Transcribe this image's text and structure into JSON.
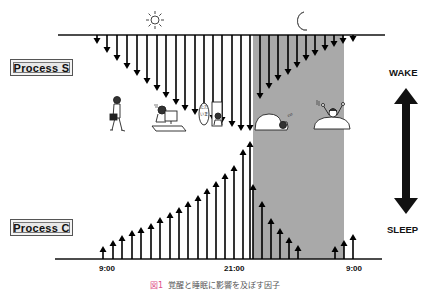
{
  "figure": {
    "process_s_label": "Process  S",
    "process_c_label": "Process  C",
    "wake_label": "WAKE",
    "sleep_label": "SLEEP",
    "x_ticks": [
      {
        "label": "9:00",
        "x": 108
      },
      {
        "label": "21:00",
        "x": 235
      },
      {
        "label": "9:00",
        "x": 356
      }
    ],
    "icons": {
      "day": "sun-icon",
      "night": "moon-icon"
    },
    "illustrations": [
      "person-walking-to-work",
      "person-at-computer",
      "person-saying-tadaima-at-door",
      "person-sleeping-in-bed",
      "person-waking-up-stretching"
    ],
    "speech_bubble_text": "ただいま",
    "caption_figure": "図1",
    "caption_text": "覚醒と睡眠に影響を及ぼす因子",
    "colors": {
      "night_shade": "#a9a9a9",
      "arrow": "#000000",
      "caption_accent": "#e0508a"
    }
  },
  "chart_data": {
    "type": "diagram",
    "time_axis": [
      "9:00",
      "21:00",
      "9:00"
    ],
    "night_period": {
      "start_x": 253,
      "end_x": 344
    },
    "process_s_down_arrows": [
      {
        "x": 97,
        "tip": 43
      },
      {
        "x": 107,
        "tip": 52
      },
      {
        "x": 117,
        "tip": 60
      },
      {
        "x": 127,
        "tip": 68
      },
      {
        "x": 137,
        "tip": 75
      },
      {
        "x": 147,
        "tip": 83
      },
      {
        "x": 157,
        "tip": 90
      },
      {
        "x": 166,
        "tip": 97
      },
      {
        "x": 176,
        "tip": 104
      },
      {
        "x": 185,
        "tip": 110
      },
      {
        "x": 195,
        "tip": 114
      },
      {
        "x": 204,
        "tip": 118
      },
      {
        "x": 213,
        "tip": 120
      },
      {
        "x": 222,
        "tip": 122
      },
      {
        "x": 232,
        "tip": 126
      },
      {
        "x": 241,
        "tip": 130
      },
      {
        "x": 250,
        "tip": 130
      },
      {
        "x": 260,
        "tip": 98
      },
      {
        "x": 269,
        "tip": 88
      },
      {
        "x": 278,
        "tip": 80
      },
      {
        "x": 288,
        "tip": 74
      },
      {
        "x": 297,
        "tip": 67
      },
      {
        "x": 306,
        "tip": 60
      },
      {
        "x": 315,
        "tip": 55
      },
      {
        "x": 325,
        "tip": 50
      },
      {
        "x": 334,
        "tip": 46
      },
      {
        "x": 343,
        "tip": 43
      },
      {
        "x": 353,
        "tip": 41
      }
    ],
    "process_c_up_arrows": [
      {
        "x": 103,
        "tip": 247
      },
      {
        "x": 113,
        "tip": 241
      },
      {
        "x": 122,
        "tip": 236
      },
      {
        "x": 132,
        "tip": 231
      },
      {
        "x": 141,
        "tip": 228
      },
      {
        "x": 151,
        "tip": 224
      },
      {
        "x": 160,
        "tip": 218
      },
      {
        "x": 170,
        "tip": 213
      },
      {
        "x": 179,
        "tip": 208
      },
      {
        "x": 188,
        "tip": 202
      },
      {
        "x": 198,
        "tip": 196
      },
      {
        "x": 207,
        "tip": 189
      },
      {
        "x": 216,
        "tip": 182
      },
      {
        "x": 225,
        "tip": 174
      },
      {
        "x": 234,
        "tip": 166
      },
      {
        "x": 243,
        "tip": 150
      },
      {
        "x": 250,
        "tip": 142
      },
      {
        "x": 253,
        "tip": 185
      },
      {
        "x": 262,
        "tip": 202
      },
      {
        "x": 271,
        "tip": 219
      },
      {
        "x": 280,
        "tip": 229
      },
      {
        "x": 289,
        "tip": 238
      },
      {
        "x": 298,
        "tip": 246
      },
      {
        "x": 335,
        "tip": 247
      },
      {
        "x": 344,
        "tip": 241
      },
      {
        "x": 353,
        "tip": 235
      }
    ],
    "legend": [
      "Process S (homeostatic sleep pressure)",
      "Process C (circadian alerting)"
    ],
    "right_scale": {
      "top": "WAKE",
      "bottom": "SLEEP"
    }
  }
}
